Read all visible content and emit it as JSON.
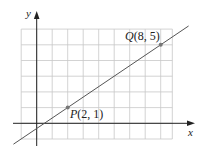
{
  "chart_data": {
    "type": "line",
    "title": "",
    "xlabel": "x",
    "ylabel": "y",
    "grid": true,
    "xlim": [
      -1,
      8.75
    ],
    "ylim": [
      -1,
      6
    ],
    "series": [
      {
        "name": "line through P and Q",
        "x": [
          -1.5,
          9.8
        ],
        "y": [
          -1.33,
          6.2
        ]
      }
    ],
    "points": [
      {
        "name": "P",
        "x": 2,
        "y": 1,
        "label": "P(2, 1)"
      },
      {
        "name": "Q",
        "x": 8,
        "y": 5,
        "label": "Q(8, 5)"
      }
    ],
    "slope": 0.6667
  },
  "labels": {
    "x_axis": "x",
    "y_axis": "y",
    "p_letter": "P",
    "p_coords": "(2, 1)",
    "q_letter": "Q",
    "q_coords": "(8, 5)"
  },
  "colors": {
    "grid": "#c8c8c8",
    "axis": "#222222",
    "line": "#555555",
    "point": "#777777"
  }
}
